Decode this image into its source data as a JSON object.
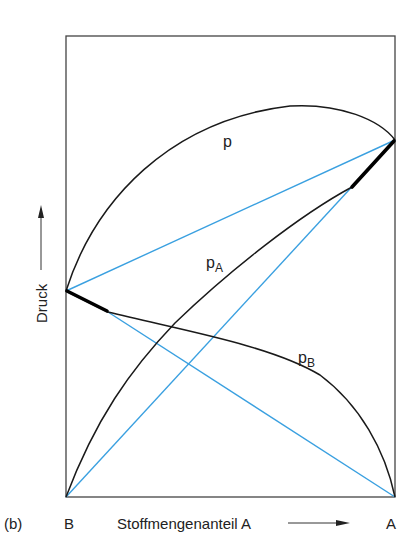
{
  "figure": {
    "panel_label": "(b)",
    "y_axis_label": "Druck",
    "x_axis_label": "Stoffmengenanteil A",
    "x_left_label": "B",
    "x_right_label": "A",
    "curve_labels": {
      "total": "p",
      "partial_a": "p",
      "partial_a_sub": "A",
      "partial_b": "p",
      "partial_b_sub": "B"
    },
    "colors": {
      "curve": "#1a1a1a",
      "tie_line": "#3aa0e0",
      "frame": "#444444"
    }
  }
}
